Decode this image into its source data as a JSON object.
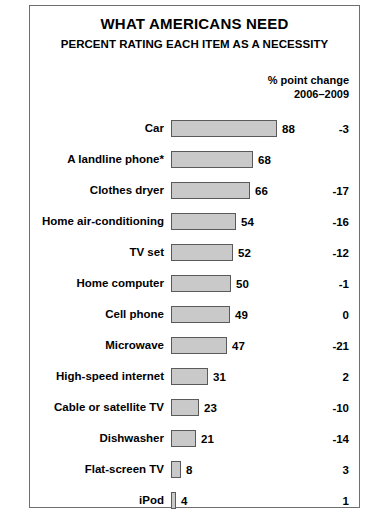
{
  "chart_data": {
    "type": "bar",
    "title": "WHAT AMERICANS NEED",
    "subtitle": "PERCENT RATING EACH ITEM AS A NECESSITY",
    "orientation": "horizontal",
    "xlabel": "",
    "ylabel": "",
    "xlim": [
      0,
      88
    ],
    "grid": false,
    "legend": false,
    "value_column_header": "",
    "change_column_header_line1": "% point change",
    "change_column_header_line2": "2006–2009",
    "categories": [
      "Car",
      "A landline phone*",
      "Clothes dryer",
      "Home air-conditioning",
      "TV set",
      "Home computer",
      "Cell phone",
      "Microwave",
      "High-speed internet",
      "Cable or satellite TV",
      "Dishwasher",
      "Flat-screen TV",
      "iPod"
    ],
    "values": [
      88,
      68,
      66,
      54,
      52,
      50,
      49,
      47,
      31,
      23,
      21,
      8,
      4
    ],
    "series": [
      {
        "name": "Percent rating each item as a necessity",
        "values": [
          88,
          68,
          66,
          54,
          52,
          50,
          49,
          47,
          31,
          23,
          21,
          8,
          4
        ]
      }
    ],
    "changes": [
      "-3",
      "",
      "-17",
      "-16",
      "-12",
      "-1",
      "0",
      "-21",
      "2",
      "-10",
      "-14",
      "3",
      "1"
    ],
    "rows": [
      {
        "label": "Car",
        "value": 88,
        "value_text": "88",
        "change": "-3"
      },
      {
        "label": "A landline phone*",
        "value": 68,
        "value_text": "68",
        "change": ""
      },
      {
        "label": "Clothes dryer",
        "value": 66,
        "value_text": "66",
        "change": "-17"
      },
      {
        "label": "Home air-conditioning",
        "value": 54,
        "value_text": "54",
        "change": "-16"
      },
      {
        "label": "TV set",
        "value": 52,
        "value_text": "52",
        "change": "-12"
      },
      {
        "label": "Home computer",
        "value": 50,
        "value_text": "50",
        "change": "-1"
      },
      {
        "label": "Cell phone",
        "value": 49,
        "value_text": "49",
        "change": "0"
      },
      {
        "label": "Microwave",
        "value": 47,
        "value_text": "47",
        "change": "-21"
      },
      {
        "label": "High-speed internet",
        "value": 31,
        "value_text": "31",
        "change": "2"
      },
      {
        "label": "Cable or satellite TV",
        "value": 23,
        "value_text": "23",
        "change": "-10"
      },
      {
        "label": "Dishwasher",
        "value": 21,
        "value_text": "21",
        "change": "-14"
      },
      {
        "label": "Flat-screen TV",
        "value": 8,
        "value_text": "8",
        "change": "3"
      },
      {
        "label": "iPod",
        "value": 4,
        "value_text": "4",
        "change": "1"
      }
    ],
    "colors": {
      "bar_fill": "#c9c9c9",
      "bar_border": "#5a5a5a",
      "frame_border": "#6f6f6f",
      "text": "#000000",
      "background": "#ffffff"
    },
    "scale_px_per_unit": 1.2
  }
}
